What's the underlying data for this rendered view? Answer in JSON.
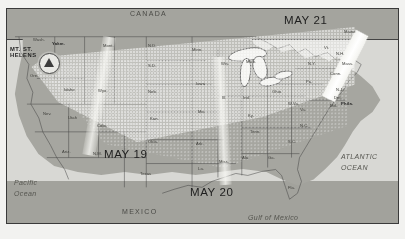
{
  "figure": {
    "kind": "map",
    "frame_border_color": "#3a3a3a"
  },
  "palette": {
    "land": "#a6a6a0",
    "water": "#d8d8d4",
    "ash_cloud": "#e8e8e2",
    "ash_band_bright": "#ffffff",
    "boundary_line": "#3a3a3a",
    "label_text": "#2a2a2a"
  },
  "date_labels": [
    {
      "id": "may-19",
      "text": "MAY 19",
      "x": 104,
      "y": 148
    },
    {
      "id": "may-20",
      "text": "MAY 20",
      "x": 190,
      "y": 186
    },
    {
      "id": "may-21",
      "text": "MAY 21",
      "x": 284,
      "y": 14
    }
  ],
  "countries": [
    {
      "id": "canada",
      "text": "CANADA",
      "x": 130,
      "y": 10
    },
    {
      "id": "mexico",
      "text": "MEXICO",
      "x": 122,
      "y": 208
    }
  ],
  "oceans": [
    {
      "id": "pacific-ocean",
      "text": "Pacific\nOcean",
      "x": 14,
      "y": 178
    },
    {
      "id": "atlantic-ocean",
      "text": "ATLANTIC\nOCEAN",
      "x": 341,
      "y": 152
    },
    {
      "id": "gulf-of-mexico",
      "text": "Gulf of Mexico",
      "x": 248,
      "y": 213
    }
  ],
  "volcano": {
    "name": "MT. ST.\nHELENS",
    "label_x": 10,
    "label_y": 46,
    "marker_x": 32,
    "marker_y": 44,
    "symbol": "volcano-triangle-icon"
  },
  "cities": [
    {
      "id": "yakima",
      "text": "Yakm.",
      "x": 52,
      "y": 42
    },
    {
      "id": "philadelphia",
      "text": "Phila.",
      "x": 341,
      "y": 102
    }
  ],
  "states": [
    {
      "id": "washington",
      "text": "Wash.",
      "x": 33,
      "y": 38
    },
    {
      "id": "oregon",
      "text": "Ore.",
      "x": 30,
      "y": 74
    },
    {
      "id": "idaho",
      "text": "Idaho",
      "x": 64,
      "y": 88
    },
    {
      "id": "montana",
      "text": "Mont.",
      "x": 103,
      "y": 44
    },
    {
      "id": "wyoming",
      "text": "Wyo.",
      "x": 98,
      "y": 89
    },
    {
      "id": "colorado",
      "text": "Colo.",
      "x": 97,
      "y": 124
    },
    {
      "id": "nevada",
      "text": "Nev.",
      "x": 43,
      "y": 112
    },
    {
      "id": "utah",
      "text": "Utah",
      "x": 68,
      "y": 116
    },
    {
      "id": "arizona",
      "text": "Ariz.",
      "x": 62,
      "y": 150
    },
    {
      "id": "new-mexico",
      "text": "N.M.",
      "x": 93,
      "y": 152
    },
    {
      "id": "north-dakota",
      "text": "N.D.",
      "x": 148,
      "y": 44
    },
    {
      "id": "south-dakota",
      "text": "S.D.",
      "x": 148,
      "y": 64
    },
    {
      "id": "nebraska",
      "text": "Neb.",
      "x": 148,
      "y": 90
    },
    {
      "id": "kansas",
      "text": "Kan.",
      "x": 150,
      "y": 117
    },
    {
      "id": "oklahoma",
      "text": "Okla.",
      "x": 148,
      "y": 140
    },
    {
      "id": "texas",
      "text": "Texas",
      "x": 140,
      "y": 172
    },
    {
      "id": "minnesota",
      "text": "Minn.",
      "x": 192,
      "y": 48
    },
    {
      "id": "iowa",
      "text": "Iowa",
      "x": 196,
      "y": 82
    },
    {
      "id": "missouri",
      "text": "Mo.",
      "x": 198,
      "y": 110
    },
    {
      "id": "arkansas",
      "text": "Ark.",
      "x": 196,
      "y": 142
    },
    {
      "id": "louisiana",
      "text": "La.",
      "x": 198,
      "y": 167
    },
    {
      "id": "wisconsin",
      "text": "Wis.",
      "x": 221,
      "y": 62
    },
    {
      "id": "illinois",
      "text": "Ill.",
      "x": 222,
      "y": 96
    },
    {
      "id": "mississippi",
      "text": "Miss.",
      "x": 219,
      "y": 160
    },
    {
      "id": "michigan",
      "text": "Mich.",
      "x": 246,
      "y": 60
    },
    {
      "id": "indiana",
      "text": "Ind.",
      "x": 243,
      "y": 96
    },
    {
      "id": "kentucky",
      "text": "Ky.",
      "x": 248,
      "y": 114
    },
    {
      "id": "tennessee",
      "text": "Tenn.",
      "x": 250,
      "y": 130
    },
    {
      "id": "alabama",
      "text": "Ala.",
      "x": 242,
      "y": 156
    },
    {
      "id": "ohio",
      "text": "Ohio",
      "x": 272,
      "y": 90
    },
    {
      "id": "west-virginia",
      "text": "W.Va.",
      "x": 288,
      "y": 102
    },
    {
      "id": "virginia",
      "text": "Va.",
      "x": 300,
      "y": 108
    },
    {
      "id": "georgia",
      "text": "Ga.",
      "x": 268,
      "y": 156
    },
    {
      "id": "florida",
      "text": "Fla.",
      "x": 288,
      "y": 186
    },
    {
      "id": "north-carolina",
      "text": "N.C.",
      "x": 300,
      "y": 124
    },
    {
      "id": "south-carolina",
      "text": "S.C.",
      "x": 288,
      "y": 140
    },
    {
      "id": "pennsylvania",
      "text": "Pa.",
      "x": 306,
      "y": 80
    },
    {
      "id": "new-york",
      "text": "N.Y.",
      "x": 308,
      "y": 62
    },
    {
      "id": "maine",
      "text": "Maine",
      "x": 344,
      "y": 30
    },
    {
      "id": "vermont",
      "text": "Vt.",
      "x": 324,
      "y": 46
    },
    {
      "id": "new-hampshire",
      "text": "N.H.",
      "x": 336,
      "y": 52
    },
    {
      "id": "massachusetts",
      "text": "Mass.",
      "x": 342,
      "y": 62
    },
    {
      "id": "connecticut",
      "text": "Conn.",
      "x": 330,
      "y": 72
    },
    {
      "id": "new-jersey",
      "text": "N.J.",
      "x": 336,
      "y": 88
    },
    {
      "id": "delaware",
      "text": "Del.",
      "x": 334,
      "y": 96
    },
    {
      "id": "maryland",
      "text": "Md.",
      "x": 330,
      "y": 104
    }
  ]
}
